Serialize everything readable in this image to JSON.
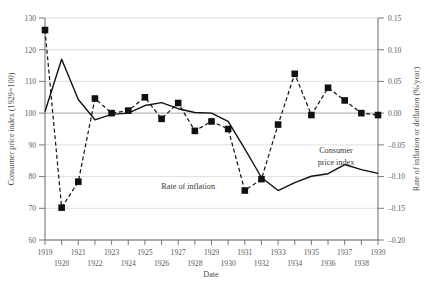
{
  "chart_data": {
    "type": "line",
    "title": "",
    "xlabel": "Date",
    "ylabel": "Consumer price index (1929=100)",
    "y2label": "Rate of inflation or deflation (%/year)",
    "grid": true,
    "legend_position": "inline-annotations",
    "xlim": [
      1919,
      1939
    ],
    "ylim": [
      60,
      130
    ],
    "y2lim": [
      -0.2,
      0.15
    ],
    "xticks": [
      1919,
      1920,
      1921,
      1922,
      1923,
      1924,
      1925,
      1926,
      1927,
      1928,
      1929,
      1930,
      1931,
      1932,
      1933,
      1934,
      1935,
      1936,
      1937,
      1938,
      1939
    ],
    "xticklabels": [
      "1919",
      "1920",
      "1921",
      "1922",
      "1923",
      "1924",
      "1925",
      "1926",
      "1927",
      "1928",
      "1929",
      "1930",
      "1931",
      "1932",
      "1933",
      "1934",
      "1935",
      "1936",
      "1937",
      "1938",
      "1939"
    ],
    "yticks": [
      60,
      70,
      80,
      90,
      100,
      110,
      120,
      130
    ],
    "yticklabels": [
      "60",
      "70",
      "80",
      "90",
      "100",
      "110",
      "120",
      "130"
    ],
    "y2ticks": [
      -0.2,
      -0.15,
      -0.1,
      -0.05,
      0.0,
      0.05,
      0.1,
      0.15
    ],
    "y2ticklabels": [
      "–0.20",
      "–0.15",
      "–0.10",
      "–0.05",
      "0.00",
      "0.05",
      "0.10",
      "0.15"
    ],
    "x": [
      1919,
      1920,
      1921,
      1922,
      1923,
      1924,
      1925,
      1926,
      1927,
      1928,
      1929,
      1930,
      1931,
      1932,
      1933,
      1934,
      1935,
      1936,
      1937,
      1938,
      1939
    ],
    "series": [
      {
        "name": "Consumer price index",
        "axis": "left",
        "style": "solid-line",
        "marker": "none",
        "annotation": "Consumer price index",
        "values": [
          100.5,
          117.0,
          104.3,
          97.9,
          99.6,
          100.0,
          102.4,
          103.3,
          101.4,
          100.2,
          100.0,
          97.4,
          88.7,
          79.7,
          75.6,
          78.1,
          80.1,
          80.9,
          83.8,
          82.2,
          81.0
        ]
      },
      {
        "name": "Rate of inflation",
        "axis": "right",
        "style": "dashed-line",
        "marker": "filled-square",
        "annotation": "Rate of inflation",
        "values": [
          0.131,
          -0.149,
          -0.108,
          0.023,
          0.0,
          0.004,
          0.025,
          -0.009,
          0.016,
          -0.028,
          -0.013,
          -0.025,
          -0.122,
          -0.104,
          -0.018,
          0.062,
          -0.003,
          0.04,
          0.02,
          0.0,
          -0.003
        ]
      }
    ]
  }
}
